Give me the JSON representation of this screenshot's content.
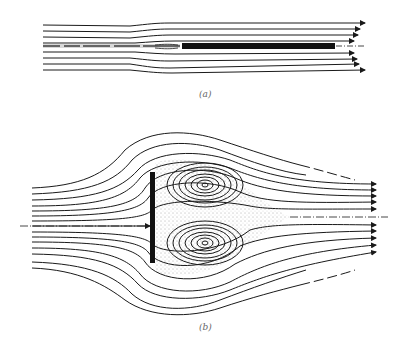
{
  "figure": {
    "panels": [
      {
        "id": "a",
        "caption": "(a)",
        "description": "Streamlines past a thin flat plate aligned with the flow"
      },
      {
        "id": "b",
        "caption": "(b)",
        "description": "Streamlines past a flat plate normal to the flow with a pair of recirculating eddies in the wake"
      }
    ],
    "colors": {
      "line": "#1a1a1a",
      "background": "#ffffff",
      "caption": "#666666",
      "stipple": "#444444"
    }
  }
}
